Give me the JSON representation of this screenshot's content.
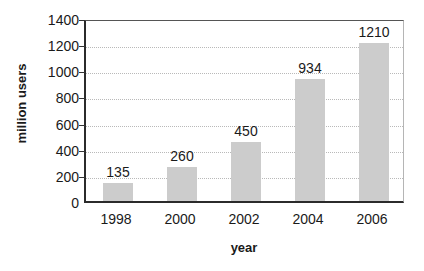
{
  "chart_data": {
    "type": "bar",
    "title": "",
    "xlabel": "year",
    "ylabel": "million users",
    "categories": [
      "1998",
      "2000",
      "2002",
      "2004",
      "2006"
    ],
    "values": [
      135,
      260,
      450,
      934,
      1210
    ],
    "value_labels": [
      "135",
      "260",
      "450",
      "934",
      "1210"
    ],
    "ylim": [
      0,
      1400
    ],
    "yticks": [
      0,
      200,
      400,
      600,
      800,
      1000,
      1200,
      1400
    ],
    "ytick_labels": [
      "0",
      "200",
      "400",
      "600",
      "800",
      "1000",
      "1200",
      "1400"
    ],
    "grid": true,
    "grid_axis": "y",
    "grid_style": "dotted",
    "legend": false,
    "legend_position": "none",
    "bar_color": "#cccccc",
    "axis_color": "#2b2b2b",
    "grid_color": "#b9b9b9",
    "text_color": "#1a1a1a",
    "background": "#ffffff"
  }
}
